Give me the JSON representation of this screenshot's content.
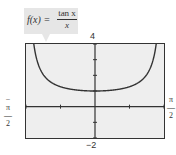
{
  "chart_data": {
    "type": "line",
    "function_label": {
      "lhs": "f(x) =",
      "numerator": "tan x",
      "denominator": "x"
    },
    "window": {
      "xmin": "-π/2",
      "xmax": "π/2",
      "ymin": "-2",
      "ymax": "4",
      "xscl": "π/4",
      "yscl": 1
    },
    "tick_labels": {
      "ymax": "4",
      "ymin": "−2",
      "xmin": "−π/2",
      "xmax": "π/2"
    },
    "xlim": [
      -1.5708,
      1.5708
    ],
    "ylim": [
      -2,
      4
    ],
    "grid": false,
    "series": [
      {
        "name": "f(x) = tan x / x",
        "x": [
          -1.3,
          -1.2,
          -1.0,
          -0.8,
          -0.6,
          -0.4,
          -0.2,
          0.0,
          0.2,
          0.4,
          0.6,
          0.8,
          1.0,
          1.2,
          1.3
        ],
        "y": [
          2.77,
          2.14,
          1.56,
          1.29,
          1.14,
          1.06,
          1.01,
          1.0,
          1.01,
          1.06,
          1.14,
          1.29,
          1.56,
          2.14,
          2.77
        ]
      }
    ],
    "note": "Curve rises toward +∞ at both vertical asymptotes x = ±π/2; value at x = 0 is undefined (hole) with limit 1."
  }
}
